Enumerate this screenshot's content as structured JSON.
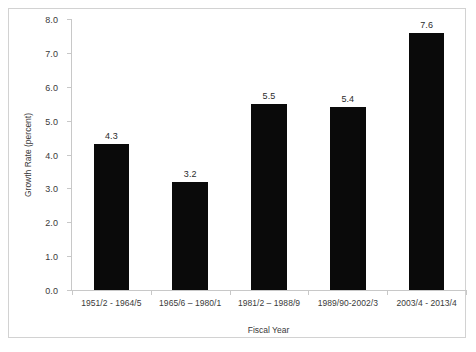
{
  "chart_data": {
    "type": "bar",
    "title": "",
    "xlabel": "Fiscal Year",
    "ylabel": "Growth Rate (percent)",
    "categories": [
      "1951/2 - 1964/5",
      "1965/6 – 1980/1",
      "1981/2 – 1988/9",
      "1989/90-2002/3",
      "2003/4 - 2013/4"
    ],
    "values": [
      4.3,
      3.2,
      5.5,
      5.4,
      7.6
    ],
    "value_labels": [
      "4.3",
      "3.2",
      "5.5",
      "5.4",
      "7.6"
    ],
    "ylim": [
      0.0,
      8.0
    ],
    "ytick_labels": [
      "0.0",
      "1.0",
      "2.0",
      "3.0",
      "4.0",
      "5.0",
      "6.0",
      "7.0",
      "8.0"
    ],
    "ytick_values": [
      0.0,
      1.0,
      2.0,
      3.0,
      4.0,
      5.0,
      6.0,
      7.0,
      8.0
    ],
    "grid": false,
    "legend": null,
    "bar_color": "#0a0a0a",
    "axis_color": "#c8c8c8",
    "frame_color": "#d2d2d2",
    "background": "#ffffff"
  }
}
